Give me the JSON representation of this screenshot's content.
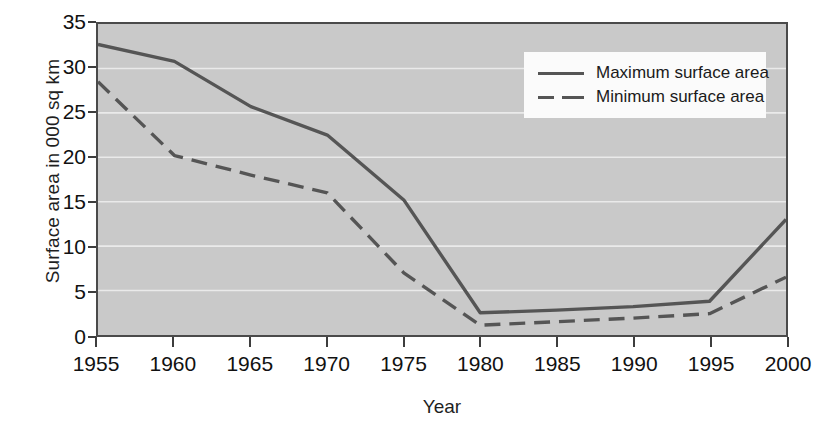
{
  "chart_data": {
    "type": "line",
    "title": "",
    "xlabel": "Year",
    "ylabel": "Surface area in 000 sq km",
    "x": [
      1955,
      1960,
      1965,
      1970,
      1975,
      1980,
      1985,
      1990,
      1995,
      2000
    ],
    "xticklabels": [
      "1955",
      "1960",
      "1965",
      "1970",
      "1975",
      "1980",
      "1985",
      "1990",
      "1995",
      "2000"
    ],
    "yticks": [
      0,
      5,
      10,
      15,
      20,
      25,
      30,
      35
    ],
    "yticklabels": [
      "0",
      "5",
      "10",
      "15",
      "20",
      "25",
      "30",
      "35"
    ],
    "xlim": [
      1955,
      2000
    ],
    "ylim": [
      0,
      35
    ],
    "grid": true,
    "grid_axis": "y",
    "legend_position": "upper right",
    "plot_background": "#c9c9c9",
    "line_color": "#555555",
    "series": [
      {
        "name": "Maximum surface area",
        "style": "solid",
        "values": [
          32.7,
          30.8,
          25.7,
          22.5,
          15.2,
          2.5,
          2.8,
          3.2,
          3.8,
          13.0
        ]
      },
      {
        "name": "Minimum surface area",
        "style": "dashed",
        "values": [
          28.5,
          20.2,
          18.0,
          16.0,
          7.0,
          1.1,
          1.5,
          1.9,
          2.4,
          6.5
        ]
      }
    ]
  },
  "legend": {
    "items": [
      {
        "label": "Maximum surface area",
        "style": "solid"
      },
      {
        "label": "Minimum surface area",
        "style": "dashed"
      }
    ]
  }
}
